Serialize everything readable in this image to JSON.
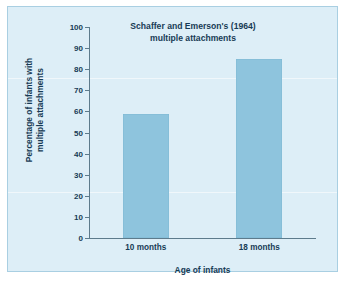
{
  "chart_data": {
    "type": "bar",
    "title": "Schaffer and Emerson's (1964) multiple attachments",
    "title_lines": [
      "Schaffer and Emerson's (1964)",
      "multiple attachments"
    ],
    "categories": [
      "10 months",
      "18 months"
    ],
    "values": [
      59,
      85
    ],
    "xlabel": "Age of infants",
    "ylabel": "Percentage of infants with multiple attachments",
    "ylabel_lines": [
      "Percentage of infants with",
      "multiple attachments"
    ],
    "ylim": [
      0,
      100
    ],
    "ytick_step": 10,
    "yticks": [
      0,
      10,
      20,
      30,
      40,
      50,
      60,
      70,
      80,
      90,
      100
    ],
    "ytick_labels": [
      "0",
      "10",
      "20",
      "30",
      "40",
      "50",
      "60",
      "70",
      "80",
      "90",
      "100"
    ],
    "grid": false,
    "legend": false,
    "colors": {
      "bar": "#8ec4dd",
      "panel_background": "#ddeef7",
      "panel_border": "#a9cfe2",
      "axis": "#5d7b8c",
      "text": "#173b55",
      "page_background": "#ffffff"
    }
  }
}
